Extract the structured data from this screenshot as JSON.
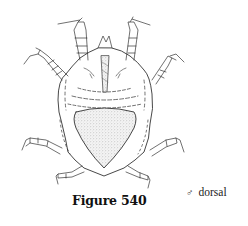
{
  "figure": {
    "caption": "Figure 540",
    "sex_symbol": "♂",
    "view": "dorsal"
  },
  "illustration": {
    "subject": "mite-dorsal-view",
    "stroke_color": "#333333",
    "stipple_color": "#bbbbbb"
  }
}
